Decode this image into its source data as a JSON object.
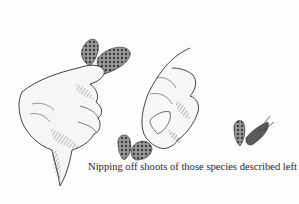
{
  "illustration": {
    "description": "Pen-and-ink drawing of hands nipping off conifer shoots",
    "elements": [
      "left-hand-holding-shoots",
      "right-hand-pinching-shoot",
      "nipped-shoots"
    ],
    "ink_color": "#2a2a2a",
    "background_color": "#fdfdfd"
  },
  "caption": {
    "text": "Nipping off shoots of those species described left"
  }
}
